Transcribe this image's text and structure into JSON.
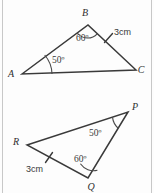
{
  "figure": {
    "type": "geometry-diagram",
    "background_color": "#fdfdfd",
    "line_color": "#3a3a3a",
    "width": 154,
    "height": 193
  },
  "triangles": [
    {
      "id": "upper",
      "name": "triangle-abc",
      "vertices": [
        {
          "label": "B",
          "x": 88,
          "y": 25,
          "label_x": 85,
          "label_y": 16
        },
        {
          "label": "A",
          "x": 22,
          "y": 74,
          "label_x": 11,
          "label_y": 77
        },
        {
          "label": "C",
          "x": 136,
          "y": 70,
          "label_x": 138,
          "label_y": 73
        }
      ],
      "angles": [
        {
          "at": "B",
          "value": "60º",
          "label_x": 76,
          "label_y": 41
        },
        {
          "at": "A",
          "value": "50º",
          "label_x": 52,
          "label_y": 63
        }
      ],
      "sides": [
        {
          "from": "B",
          "to": "C",
          "length": "3cm",
          "label_x": 114,
          "label_y": 35,
          "tick": true
        }
      ]
    },
    {
      "id": "lower",
      "name": "triangle-pqr",
      "vertices": [
        {
          "label": "P",
          "x": 128,
          "y": 112,
          "label_x": 132,
          "label_y": 110
        },
        {
          "label": "R",
          "x": 27,
          "y": 145,
          "label_x": 13,
          "label_y": 145
        },
        {
          "label": "Q",
          "x": 88,
          "y": 178,
          "label_x": 87,
          "label_y": 190
        }
      ],
      "angles": [
        {
          "at": "P",
          "value": "50º",
          "label_x": 89,
          "label_y": 136
        },
        {
          "at": "Q",
          "value": "60º",
          "label_x": 74,
          "label_y": 162
        }
      ],
      "sides": [
        {
          "from": "R",
          "to": "Q",
          "length": "3cm",
          "label_x": 26,
          "label_y": 172,
          "tick": true
        }
      ]
    }
  ]
}
